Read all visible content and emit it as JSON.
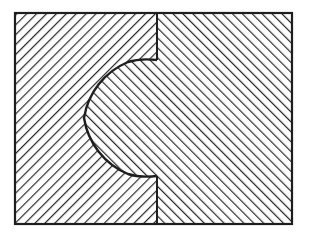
{
  "diagram": {
    "colors": {
      "background": "#ffffff",
      "line": "#2a2a2a",
      "outline": "#1e1e1e"
    },
    "frame": {
      "x": 15,
      "y": 13,
      "width": 277,
      "height": 211
    },
    "divider_x": 157,
    "notch": {
      "top_y": 60,
      "bottom_y": 176,
      "center_y": 118,
      "radius": 73
    },
    "regions": [
      {
        "id": "left-part",
        "hatch": "backslash",
        "hatch_angle": 45
      },
      {
        "id": "right-part",
        "hatch": "forward-slash",
        "hatch_angle": -45
      }
    ]
  }
}
